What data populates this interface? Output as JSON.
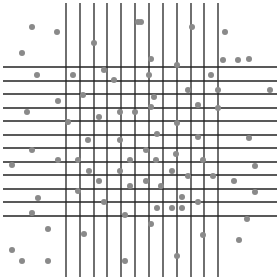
{
  "canvas": {
    "width": 280,
    "height": 277,
    "background": "#ffffff"
  },
  "style": {
    "line_color": "#222222",
    "line_width": 1.3,
    "dot_color": "#8a8a8a",
    "dot_radius": 3
  },
  "grid": {
    "vertical_lines": {
      "x": [
        66,
        80,
        94,
        107,
        121,
        135,
        149,
        163,
        177,
        191,
        204,
        218
      ],
      "y_start": 3,
      "y_end": 277
    },
    "horizontal_lines": {
      "y": [
        67,
        81,
        94,
        108,
        121,
        135,
        148,
        162,
        175,
        189,
        202,
        216
      ],
      "x_start": 3,
      "x_end": 277
    }
  },
  "dots": [
    [
      32,
      27
    ],
    [
      57,
      32
    ],
    [
      22,
      53
    ],
    [
      94,
      43
    ],
    [
      138,
      22
    ],
    [
      141,
      22
    ],
    [
      151,
      59
    ],
    [
      192,
      27
    ],
    [
      225,
      32
    ],
    [
      223,
      60
    ],
    [
      249,
      59
    ],
    [
      37,
      75
    ],
    [
      73,
      75
    ],
    [
      104,
      70
    ],
    [
      114,
      80
    ],
    [
      149,
      75
    ],
    [
      177,
      65
    ],
    [
      211,
      75
    ],
    [
      238,
      60
    ],
    [
      83,
      95
    ],
    [
      58,
      101
    ],
    [
      154,
      97
    ],
    [
      188,
      90
    ],
    [
      218,
      90
    ],
    [
      270,
      90
    ],
    [
      27,
      112
    ],
    [
      99,
      117
    ],
    [
      68,
      122
    ],
    [
      120,
      112
    ],
    [
      135,
      112
    ],
    [
      151,
      107
    ],
    [
      198,
      105
    ],
    [
      218,
      108
    ],
    [
      177,
      123
    ],
    [
      157,
      134
    ],
    [
      198,
      137
    ],
    [
      249,
      138
    ],
    [
      88,
      140
    ],
    [
      120,
      140
    ],
    [
      32,
      150
    ],
    [
      146,
      150
    ],
    [
      176,
      154
    ],
    [
      12,
      165
    ],
    [
      58,
      160
    ],
    [
      78,
      160
    ],
    [
      130,
      160
    ],
    [
      156,
      160
    ],
    [
      203,
      160
    ],
    [
      255,
      166
    ],
    [
      89,
      171
    ],
    [
      120,
      171
    ],
    [
      172,
      171
    ],
    [
      99,
      181
    ],
    [
      146,
      181
    ],
    [
      188,
      176
    ],
    [
      213,
      176
    ],
    [
      234,
      181
    ],
    [
      130,
      186
    ],
    [
      161,
      186
    ],
    [
      78,
      191
    ],
    [
      255,
      192
    ],
    [
      182,
      197
    ],
    [
      104,
      202
    ],
    [
      198,
      202
    ],
    [
      38,
      198
    ],
    [
      157,
      208
    ],
    [
      172,
      208
    ],
    [
      182,
      208
    ],
    [
      32,
      213
    ],
    [
      125,
      215
    ],
    [
      247,
      219
    ],
    [
      151,
      224
    ],
    [
      48,
      229
    ],
    [
      84,
      234
    ],
    [
      203,
      235
    ],
    [
      239,
      240
    ],
    [
      12,
      250
    ],
    [
      22,
      261
    ],
    [
      48,
      261
    ],
    [
      125,
      261
    ],
    [
      177,
      256
    ]
  ]
}
